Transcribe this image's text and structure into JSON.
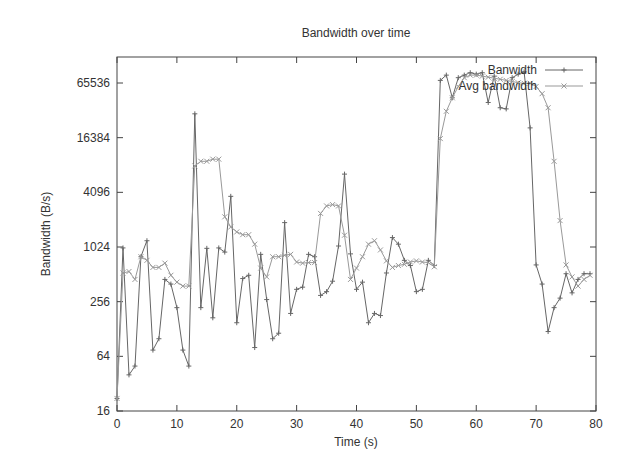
{
  "chart_data": {
    "type": "line",
    "title": "Bandwidth over time",
    "xlabel": "Time (s)",
    "ylabel": "Bandwidth (B/s)",
    "xlim": [
      0,
      80
    ],
    "ylim": [
      16,
      131072
    ],
    "yscale": "log2",
    "xticks": [
      0,
      10,
      20,
      30,
      40,
      50,
      60,
      70,
      80
    ],
    "yticks": [
      16,
      64,
      256,
      1024,
      4096,
      16384,
      65536
    ],
    "ytick_labels": [
      "16",
      "64",
      "256",
      "1024",
      "4096",
      "16384",
      "65536"
    ],
    "xtick_labels": [
      "0",
      "10",
      "20",
      "30",
      "40",
      "50",
      "60",
      "70",
      "80"
    ],
    "grid": false,
    "legend_position": "top-right",
    "x": [
      0,
      1,
      2,
      3,
      4,
      5,
      6,
      7,
      8,
      9,
      10,
      11,
      12,
      13,
      14,
      15,
      16,
      17,
      18,
      19,
      20,
      21,
      22,
      23,
      24,
      25,
      26,
      27,
      28,
      29,
      30,
      31,
      32,
      33,
      34,
      35,
      36,
      37,
      38,
      39,
      40,
      41,
      42,
      43,
      44,
      45,
      46,
      47,
      48,
      49,
      50,
      51,
      52,
      53,
      54,
      55,
      56,
      57,
      58,
      59,
      60,
      61,
      62,
      63,
      64,
      65,
      66,
      67,
      68,
      69,
      70,
      71,
      72,
      73,
      74,
      75,
      76,
      77,
      78,
      79
    ],
    "series": [
      {
        "name": "Banwidth",
        "color": "#666666",
        "marker": "plus",
        "values": [
          22,
          1000,
          40,
          50,
          800,
          1200,
          75,
          100,
          450,
          400,
          220,
          75,
          50,
          30000,
          220,
          990,
          170,
          1000,
          900,
          3700,
          150,
          460,
          500,
          80,
          850,
          270,
          100,
          115,
          1900,
          190,
          350,
          370,
          850,
          800,
          300,
          330,
          430,
          1050,
          6500,
          860,
          350,
          420,
          150,
          190,
          180,
          530,
          1300,
          1100,
          730,
          640,
          330,
          350,
          730,
          640,
          70000,
          80000,
          45000,
          75000,
          80000,
          85000,
          82000,
          85000,
          40000,
          78000,
          35000,
          34000,
          75000,
          82000,
          87000,
          21000,
          650,
          400,
          120,
          220,
          280,
          520,
          320,
          450,
          520,
          520
        ]
      },
      {
        "name": "Avg bandwidth",
        "color": "#999999",
        "marker": "x",
        "values": [
          22,
          530,
          550,
          450,
          800,
          730,
          610,
          610,
          680,
          500,
          420,
          380,
          380,
          8000,
          9000,
          9000,
          9500,
          9500,
          2200,
          1700,
          1500,
          1400,
          1400,
          1100,
          600,
          480,
          800,
          800,
          830,
          850,
          700,
          680,
          690,
          690,
          2400,
          2900,
          3000,
          2900,
          1380,
          450,
          600,
          800,
          1100,
          1200,
          950,
          720,
          610,
          640,
          660,
          700,
          720,
          700,
          690,
          620,
          16000,
          32000,
          45000,
          60000,
          75000,
          80000,
          80000,
          78000,
          76000,
          74000,
          72000,
          70000,
          68000,
          66000,
          65000,
          65000,
          60000,
          50000,
          35000,
          9000,
          2000,
          650,
          480,
          380,
          450,
          500
        ]
      }
    ]
  }
}
